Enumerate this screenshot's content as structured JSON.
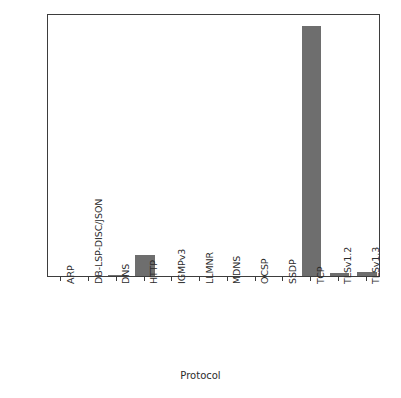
{
  "chart_data": {
    "type": "bar",
    "title": "",
    "xlabel": "Protocol",
    "ylabel": "",
    "categories": [
      "ARP",
      "DB-LSP-DISC/JSON",
      "DNS",
      "HTTP",
      "IGMPv3",
      "LLMNR",
      "MDNS",
      "OCSP",
      "SSDP",
      "TCP",
      "TLSv1.2",
      "TLSv1.3"
    ],
    "values": [
      0.0,
      0.0,
      0.006,
      0.155,
      0.0,
      0.0,
      0.0,
      0.0,
      0.0,
      1.885,
      0.026,
      0.028
    ],
    "ylim": [
      0.0,
      1.98
    ],
    "yticks": [
      0.0,
      0.25,
      0.5,
      0.75,
      1.0,
      1.25,
      1.5,
      1.75
    ],
    "ytick_labels": [
      "0.00",
      "0.25",
      "0.50",
      "0.75",
      "1.00",
      "1.25",
      "1.50",
      "1.75"
    ],
    "grid": false,
    "legend": false,
    "bar_color": "#6e6e6e",
    "axis_color": "#3d3d3d",
    "background_color": "#ffffff",
    "tick_label_rotation": -90
  }
}
